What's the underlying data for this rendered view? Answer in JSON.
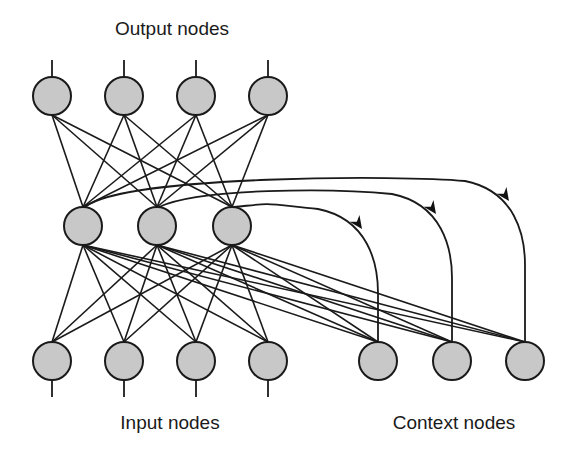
{
  "labels": {
    "output": "Output nodes",
    "input": "Input nodes",
    "context": "Context nodes"
  },
  "colors": {
    "node_fill": "#c8c8c8",
    "stroke": "#1a1a1a",
    "background": "#ffffff"
  },
  "layers": {
    "output": {
      "count": 4,
      "has_stub_above": true
    },
    "hidden": {
      "count": 3
    },
    "input": {
      "count": 4,
      "has_stub_below": true
    },
    "context": {
      "count": 3
    }
  },
  "connections": [
    {
      "from": "hidden",
      "to": "output",
      "pattern": "fully-connected"
    },
    {
      "from": "input",
      "to": "hidden",
      "pattern": "fully-connected"
    },
    {
      "from": "context",
      "to": "hidden",
      "pattern": "fully-connected"
    }
  ],
  "recurrent_copies": [
    {
      "from_hidden": 0,
      "to_context": 2,
      "arrow": true
    },
    {
      "from_hidden": 1,
      "to_context": 1,
      "arrow": true
    },
    {
      "from_hidden": 2,
      "to_context": 0,
      "arrow": true
    }
  ]
}
